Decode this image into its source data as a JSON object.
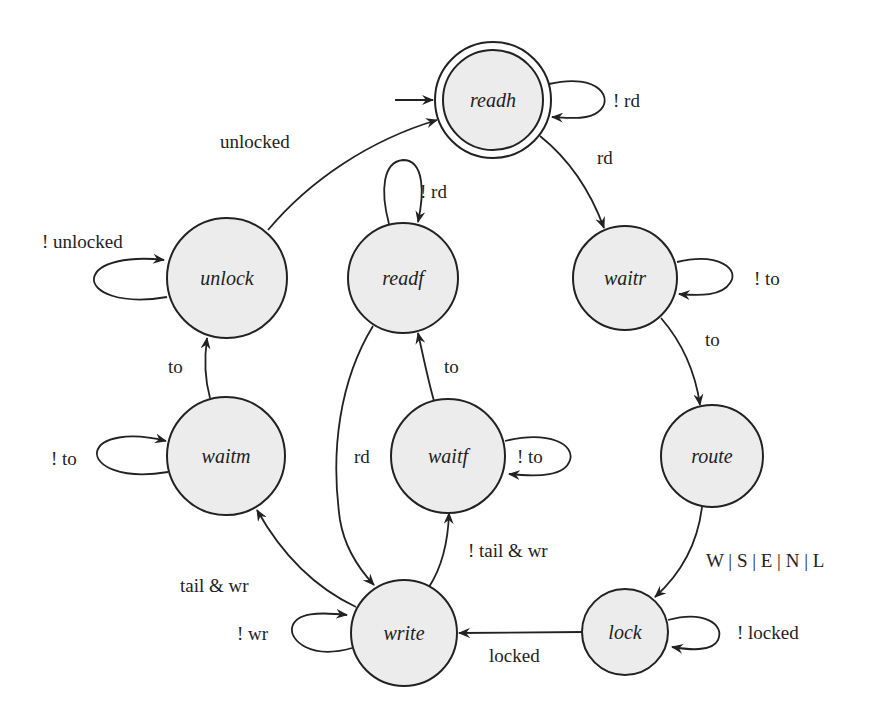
{
  "diagram": {
    "type": "state-machine",
    "states": [
      {
        "id": "readh",
        "label": "readh",
        "initial": true,
        "accepting": true
      },
      {
        "id": "unlock",
        "label": "unlock"
      },
      {
        "id": "readf",
        "label": "readf"
      },
      {
        "id": "waitr",
        "label": "waitr"
      },
      {
        "id": "waitm",
        "label": "waitm"
      },
      {
        "id": "waitf",
        "label": "waitf"
      },
      {
        "id": "route",
        "label": "route"
      },
      {
        "id": "write",
        "label": "write"
      },
      {
        "id": "lock",
        "label": "lock"
      }
    ],
    "transitions": [
      {
        "from": "readh",
        "to": "readh",
        "label": "! rd"
      },
      {
        "from": "readh",
        "to": "waitr",
        "label": "rd"
      },
      {
        "from": "waitr",
        "to": "waitr",
        "label": "! to"
      },
      {
        "from": "waitr",
        "to": "route",
        "label": "to"
      },
      {
        "from": "route",
        "to": "lock",
        "label": "W | S | E | N | L"
      },
      {
        "from": "lock",
        "to": "lock",
        "label": "! locked"
      },
      {
        "from": "lock",
        "to": "write",
        "label": "locked"
      },
      {
        "from": "write",
        "to": "write",
        "label": "! wr"
      },
      {
        "from": "write",
        "to": "waitm",
        "label": "tail  & wr"
      },
      {
        "from": "write",
        "to": "waitf",
        "label": "! tail  & wr"
      },
      {
        "from": "waitf",
        "to": "waitf",
        "label": "! to"
      },
      {
        "from": "waitf",
        "to": "readf",
        "label": "to"
      },
      {
        "from": "readf",
        "to": "readf",
        "label": "! rd"
      },
      {
        "from": "readf",
        "to": "write",
        "label": "rd"
      },
      {
        "from": "waitm",
        "to": "waitm",
        "label": "! to"
      },
      {
        "from": "waitm",
        "to": "unlock",
        "label": "to"
      },
      {
        "from": "unlock",
        "to": "unlock",
        "label": "! unlocked"
      },
      {
        "from": "unlock",
        "to": "readh",
        "label": "unlocked"
      }
    ]
  }
}
